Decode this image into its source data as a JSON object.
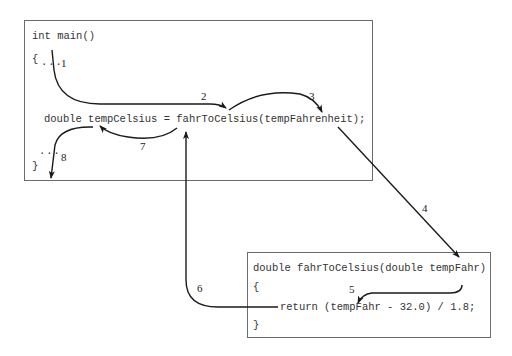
{
  "main_function": {
    "signature": "int main()",
    "open_brace": "{",
    "ellipsis_top": "...",
    "statement": "double tempCelsius = fahrToCelsius(tempFahrenheit);",
    "ellipsis_bottom": "...",
    "close_brace": "}"
  },
  "called_function": {
    "signature": "double fahrToCelsius(double tempFahr)",
    "open_brace": "{",
    "statement": "return (tempFahr - 32.0) / 1.8;",
    "close_brace": "}"
  },
  "steps": [
    {
      "id": 1,
      "label": "1",
      "description": "execution enters main"
    },
    {
      "id": 2,
      "label": "2",
      "description": "flows to call of fahrToCelsius"
    },
    {
      "id": 3,
      "label": "3",
      "description": "argument tempFahrenheit evaluated"
    },
    {
      "id": 4,
      "label": "4",
      "description": "value passed to parameter tempFahr"
    },
    {
      "id": 5,
      "label": "5",
      "description": "function body executes return"
    },
    {
      "id": 6,
      "label": "6",
      "description": "return value goes back to call site"
    },
    {
      "id": 7,
      "label": "7",
      "description": "value assigned to tempCelsius"
    },
    {
      "id": 8,
      "label": "8",
      "description": "execution continues in main"
    }
  ],
  "colors": {
    "line": "#1a1a1a",
    "box_border": "#6b6b6b",
    "code_text": "#333333"
  }
}
